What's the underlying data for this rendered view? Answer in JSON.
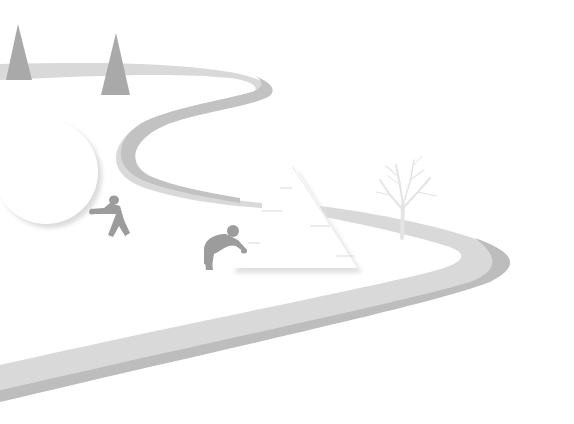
{
  "illustration": {
    "description": "Grayscale illustration of a winding road with two figures pushing shapes (a circle and a triangle)",
    "colors": {
      "background": "#ffffff",
      "road_light": "#d9d9d9",
      "road_dark": "#bdbdbd",
      "tree": "#a9a9a9",
      "figure": "#9a9a9a",
      "bare_tree": "#e6e6e6",
      "shape_fill": "#ffffff",
      "shape_shadow": "#e2e2e2"
    },
    "elements": {
      "trees": [
        "pine-tree-left",
        "pine-tree-right"
      ],
      "shapes": [
        "circle",
        "triangle"
      ],
      "figures": [
        "figure-pushing-circle",
        "figure-pushing-triangle"
      ],
      "bare_tree": "bare-tree"
    }
  }
}
